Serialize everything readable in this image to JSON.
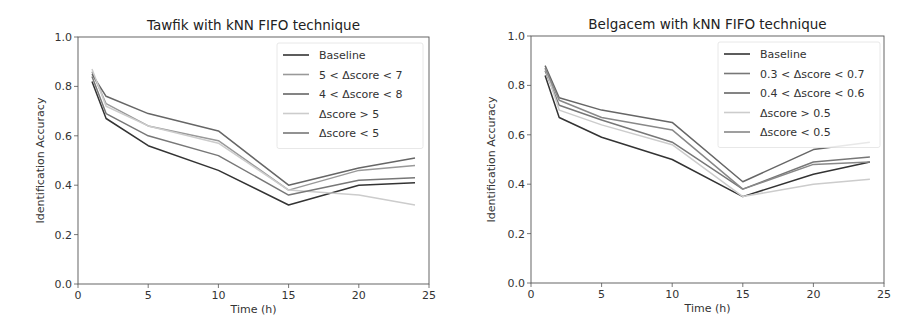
{
  "chart_data": [
    {
      "type": "line",
      "title": "Tawfik with kNN FIFO technique",
      "xlabel": "Time (h)",
      "ylabel": "Identification Accuracy",
      "xlim": [
        0,
        25
      ],
      "ylim": [
        0.0,
        1.0
      ],
      "xticks": [
        "0",
        "5",
        "10",
        "15",
        "20",
        "25"
      ],
      "yticks": [
        "0.0",
        "0.2",
        "0.4",
        "0.6",
        "0.8",
        "1.0"
      ],
      "grid": false,
      "legend_position": "upper right",
      "x": [
        1,
        2,
        5,
        10,
        15,
        20,
        24
      ],
      "series": [
        {
          "name": "Baseline",
          "color": "#333333",
          "values": [
            0.82,
            0.67,
            0.56,
            0.46,
            0.32,
            0.4,
            0.41
          ]
        },
        {
          "name": "5 < Δscore < 7",
          "color": "#999999",
          "values": [
            0.86,
            0.73,
            0.64,
            0.58,
            0.38,
            0.46,
            0.48
          ]
        },
        {
          "name": "4 < Δscore < 8",
          "color": "#666666",
          "values": [
            0.85,
            0.76,
            0.69,
            0.62,
            0.4,
            0.47,
            0.51
          ]
        },
        {
          "name": "Δscore > 5",
          "color": "#cccccc",
          "values": [
            0.87,
            0.72,
            0.64,
            0.57,
            0.38,
            0.36,
            0.32
          ]
        },
        {
          "name": "Δscore < 5",
          "color": "#777777",
          "values": [
            0.84,
            0.69,
            0.6,
            0.52,
            0.36,
            0.42,
            0.43
          ]
        }
      ]
    },
    {
      "type": "line",
      "title": "Belgacem with kNN FIFO technique",
      "xlabel": "Time (h)",
      "ylabel": "Identification Accuracy",
      "xlim": [
        0,
        25
      ],
      "ylim": [
        0.0,
        1.0
      ],
      "xticks": [
        "0",
        "5",
        "10",
        "15",
        "20",
        "25"
      ],
      "yticks": [
        "0.0",
        "0.2",
        "0.4",
        "0.6",
        "0.8",
        "1.0"
      ],
      "grid": false,
      "legend_position": "upper right",
      "x": [
        1,
        2,
        5,
        10,
        15,
        20,
        24
      ],
      "series": [
        {
          "name": "Baseline",
          "color": "#333333",
          "values": [
            0.84,
            0.67,
            0.59,
            0.5,
            0.35,
            0.44,
            0.49
          ]
        },
        {
          "name": "0.3 < Δscore < 0.7",
          "color": "#777777",
          "values": [
            0.86,
            0.72,
            0.66,
            0.57,
            0.38,
            0.49,
            0.51
          ]
        },
        {
          "name": "0.4 < Δscore < 0.6",
          "color": "#666666",
          "values": [
            0.88,
            0.75,
            0.7,
            0.65,
            0.41,
            0.54,
            0.57
          ]
        },
        {
          "name": "Δscore > 0.5",
          "color": "#cccccc",
          "values": [
            0.87,
            0.7,
            0.64,
            0.56,
            0.35,
            0.4,
            0.42
          ]
        },
        {
          "name": "Δscore < 0.5",
          "color": "#888888",
          "values": [
            0.87,
            0.74,
            0.67,
            0.62,
            0.38,
            0.48,
            0.49
          ]
        }
      ]
    }
  ]
}
